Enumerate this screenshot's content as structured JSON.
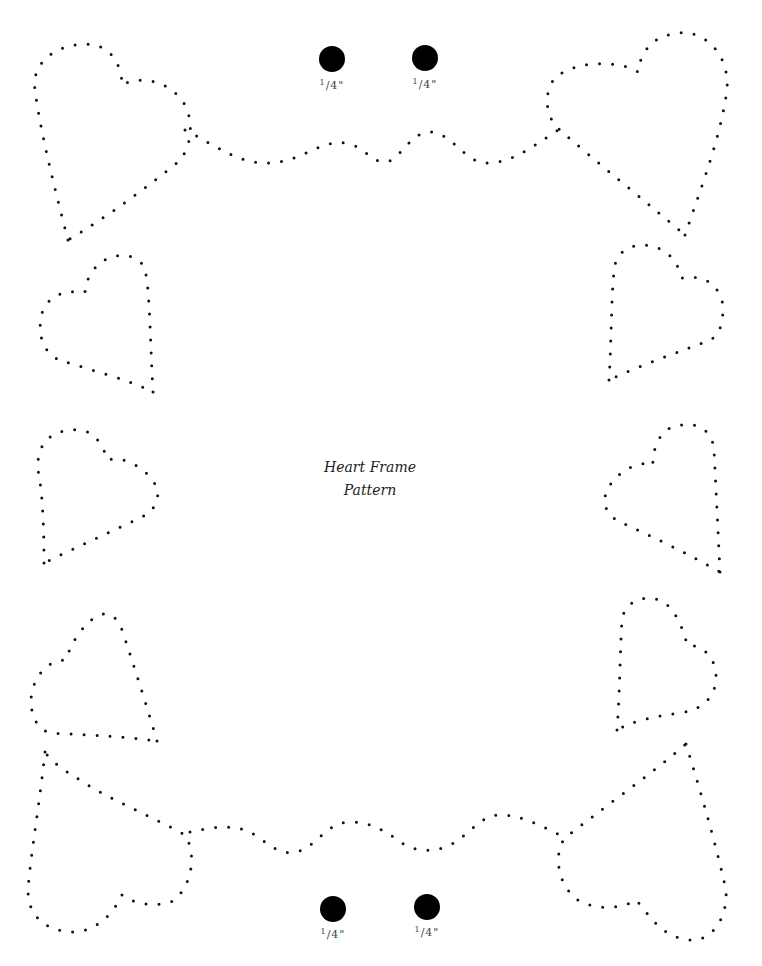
{
  "document": {
    "title_line1": "Heart Frame",
    "title_line2": "Pattern",
    "colors": {
      "ink": "#111111",
      "paper": "#ffffff",
      "label": "#444444"
    }
  },
  "holes": [
    {
      "cx": 332,
      "cy": 59,
      "r": 13,
      "label_num": "1",
      "label_rest": "/4\"",
      "label_x": 312,
      "label_y": 78
    },
    {
      "cx": 425,
      "cy": 58,
      "r": 13,
      "label_num": "1",
      "label_rest": "/4\"",
      "label_x": 405,
      "label_y": 77
    },
    {
      "cx": 333,
      "cy": 909,
      "r": 13,
      "label_num": "1",
      "label_rest": "/4\"",
      "label_x": 313,
      "label_y": 927
    },
    {
      "cx": 427,
      "cy": 907,
      "r": 13,
      "label_num": "1",
      "label_rest": "/4\"",
      "label_x": 407,
      "label_y": 925
    }
  ],
  "dotted_paths": [
    {
      "name": "heart-top-left",
      "d": "M 68 240 C 55 190 40 130 35 90 C 30 55 70 40 95 45 C 115 50 122 70 122 85 C 140 75 170 80 185 105 C 195 125 190 150 178 162 C 150 185 110 215 68 240"
    },
    {
      "name": "heart-top-right",
      "d": "M 685 235 C 700 190 720 140 727 90 C 730 50 700 30 680 33 C 650 35 640 55 638 72 C 620 60 575 60 555 78 C 543 92 545 118 560 130 C 600 165 650 205 685 235"
    },
    {
      "name": "wave-top",
      "d": "M 185 130 C 215 145 240 165 270 163 C 300 162 320 140 345 143 C 365 146 370 162 385 162 C 400 162 410 130 432 132 C 455 135 465 165 490 163 C 515 161 535 145 558 130"
    },
    {
      "name": "heart-left-2",
      "d": "M 153 392 C 150 340 150 290 145 270 C 140 252 110 250 95 268 C 85 280 85 292 85 292 C 65 290 50 295 43 310 C 35 335 45 355 60 360 C 90 370 130 380 153 392"
    },
    {
      "name": "heart-right-2",
      "d": "M 609 380 C 612 330 611 290 615 265 C 620 240 660 238 675 262 C 680 270 682 278 682 278 C 700 275 715 280 722 300 C 725 320 720 335 710 340 C 680 352 640 365 609 380"
    },
    {
      "name": "heart-left-3",
      "d": "M 44 563 C 44 520 42 490 38 470 C 36 440 55 428 80 430 C 100 432 105 455 108 460 C 125 455 150 470 158 490 C 158 505 152 512 140 518 C 110 532 75 548 44 563"
    },
    {
      "name": "heart-right-3",
      "d": "M 720 572 C 718 530 716 490 714 450 C 712 425 690 420 670 428 C 655 435 652 460 653 465 C 640 460 620 470 610 485 C 600 500 605 515 620 522 C 650 535 690 555 720 572"
    },
    {
      "name": "heart-left-4",
      "d": "M 157 741 C 145 700 132 660 122 630 C 113 605 95 612 80 632 C 70 645 66 660 66 660 C 45 660 32 680 31 700 C 31 720 40 730 50 733 C 90 735 130 737 157 741"
    },
    {
      "name": "heart-right-4",
      "d": "M 617 730 C 620 690 620 650 622 620 C 625 598 650 593 665 603 C 680 615 686 640 687 645 C 705 645 717 660 716 680 C 714 700 700 710 680 713 C 655 716 630 722 617 730"
    },
    {
      "name": "heart-bottom-left",
      "d": "M 45 752 C 40 800 30 860 28 890 C 28 920 50 932 75 932 C 100 930 115 910 122 895 C 135 905 160 908 175 900 C 195 880 195 850 185 835 C 160 820 110 800 80 780 C 60 768 50 760 45 752"
    },
    {
      "name": "heart-bottom-right",
      "d": "M 686 744 C 700 790 715 840 726 890 C 728 920 710 942 690 940 C 660 937 650 915 636 900 C 620 910 590 910 575 898 C 555 880 555 850 565 838 C 600 810 650 775 686 744"
    },
    {
      "name": "wave-bottom",
      "d": "M 190 832 C 210 828 235 822 255 835 C 270 845 280 855 295 852 C 315 850 325 822 350 822 C 375 822 390 835 405 845 C 420 852 435 852 450 845 C 470 835 480 815 500 815 C 520 815 540 825 560 835"
    }
  ]
}
